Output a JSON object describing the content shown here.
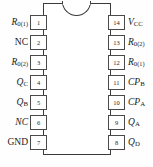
{
  "diagram": {
    "package": "DIP-14",
    "notch": "top-center-semicircle",
    "outline_color": "#3a3a3a",
    "body_color": "#ffffff",
    "text_color": "#1a1a1a"
  },
  "pins": {
    "left": [
      {
        "number": "1",
        "label_html": "<span class=\"it\">R</span><sub>0</sub><sub class=\"paren\">(1)</sub>",
        "signal": "R0(1)"
      },
      {
        "number": "2",
        "label_html": "NC",
        "signal": "NC"
      },
      {
        "number": "3",
        "label_html": "<span class=\"it\">R</span><sub>0</sub><sub class=\"paren\">(2)</sub>",
        "signal": "R0(2)"
      },
      {
        "number": "4",
        "label_html": "<span class=\"it\">Q</span><sub>C</sub>",
        "signal": "QC"
      },
      {
        "number": "5",
        "label_html": "<span class=\"it\">Q</span><sub>B</sub>",
        "signal": "QB"
      },
      {
        "number": "6",
        "label_html": "<span class=\"it\">NC</span>",
        "signal": "NC"
      },
      {
        "number": "7",
        "label_html": "GND",
        "signal": "GND"
      }
    ],
    "right": [
      {
        "number": "14",
        "label_html": "<span class=\"it\">V</span><sub>CC</sub>",
        "signal": "VCC"
      },
      {
        "number": "13",
        "label_html": "<span class=\"it\">R</span><sub>0</sub><sub class=\"paren\">(2)</sub>",
        "signal": "R0(2)"
      },
      {
        "number": "12",
        "label_html": "<span class=\"it\">R</span><sub>0</sub><sub class=\"paren\">(1)</sub>",
        "signal": "R0(1)"
      },
      {
        "number": "11",
        "label_html": "<span class=\"it\">CP</span><sub>B</sub>",
        "signal": "CPB"
      },
      {
        "number": "10",
        "label_html": "<span class=\"it\">CP</span><sub>A</sub>",
        "signal": "CPA"
      },
      {
        "number": "9",
        "label_html": "<span class=\"it\">Q</span><sub>A</sub>",
        "signal": "QA"
      },
      {
        "number": "8",
        "label_html": "<span class=\"it\">Q</span><sub>D</sub>",
        "signal": "QD"
      }
    ]
  },
  "layout": {
    "pin_top_start": 15,
    "pin_spacing": 20
  }
}
